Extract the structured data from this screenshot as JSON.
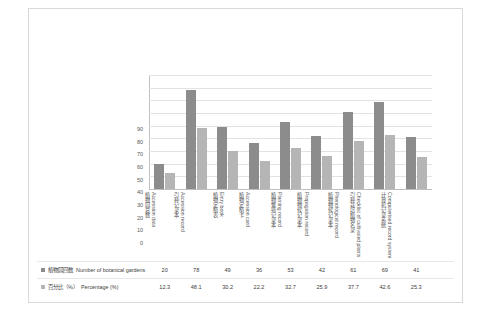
{
  "chart_data": {
    "type": "bar",
    "title": "",
    "xlabel": "",
    "ylabel": "",
    "ylim": [
      0,
      90
    ],
    "yticks": [
      0,
      10,
      20,
      30,
      40,
      50,
      60,
      70,
      80,
      90
    ],
    "grid": true,
    "legend_position": "bottom-table",
    "categories_cjk": [
      "植物园总数",
      "引种记录本",
      "植物定植表",
      "植物定植卡",
      "植物繁殖记录本",
      "植物物候记录本",
      "引种栽培植物名录",
      "计算机记录系统"
    ],
    "categories_en": [
      "Accession data",
      "Accession record",
      "Entry book",
      "Accession card",
      "Planting record",
      "Propagation record",
      "Phenological record",
      "Checklist of cultivated plants",
      "Computerised record system"
    ],
    "categories": [
      {
        "cjk": "植物园总数",
        "en": "Accession data"
      },
      {
        "cjk": "引种记录本",
        "en": "Accession record"
      },
      {
        "cjk": "植物定植表",
        "en": "Entry book"
      },
      {
        "cjk": "植物定植卡",
        "en": "Accession card"
      },
      {
        "cjk": "植物繁殖记录本",
        "en": "Planting record"
      },
      {
        "cjk": "植物物候记录本",
        "en": "Propagation record"
      },
      {
        "cjk": "植物物候记录本",
        "en": "Phenological record"
      },
      {
        "cjk": "引种栽培植物名录",
        "en": "Checklist of cultivated plants"
      },
      {
        "cjk": "计算机记录系统",
        "en": "Computerised record system"
      }
    ],
    "series": [
      {
        "name_cjk": "植物园回数",
        "name_en": "Number of botanical gardens",
        "color": "#8c8c8c",
        "values": [
          20,
          78,
          49,
          36,
          53,
          42,
          61,
          69,
          41
        ]
      },
      {
        "name_cjk": "百分比（％）",
        "name_en": "Percentage (%)",
        "color": "#b5b5b5",
        "values": [
          12.3,
          48.1,
          30.2,
          22.2,
          32.7,
          25.9,
          37.7,
          42.6,
          25.3
        ]
      }
    ]
  },
  "table": {
    "rows": [
      {
        "label_cjk": "植物园回数",
        "label_en": "Number of botanical gardens",
        "values": [
          "20",
          "78",
          "49",
          "36",
          "53",
          "42",
          "61",
          "69",
          "41"
        ]
      },
      {
        "label_cjk": "百分比（％）",
        "label_en": "Percentage (%)",
        "values": [
          "12.3",
          "48.1",
          "30.2",
          "22.2",
          "32.7",
          "25.9",
          "37.7",
          "42.6",
          "25.3"
        ]
      }
    ]
  }
}
